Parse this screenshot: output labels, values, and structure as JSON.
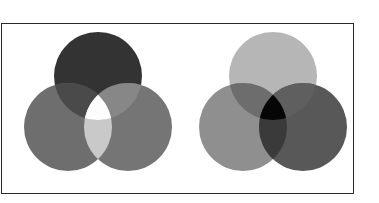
{
  "page": {
    "background_color": "#ffffff",
    "width": 379,
    "height": 203
  },
  "frame": {
    "border_color": "#2a2a2a",
    "border_width": 1,
    "background_color": "#ffffff"
  },
  "figure": {
    "title": "",
    "caption": "",
    "diagram_count": 2
  },
  "chart_data": {
    "type": "diagram",
    "subtype": "venn",
    "title": "",
    "geometry": {
      "circle_radius": 44,
      "viewbox": "0 0 176 169"
    },
    "diagrams": [
      {
        "id": "additive",
        "name": "additive-mixing",
        "label": "",
        "center_result": "white",
        "center_color": "#fdfdfd",
        "circles": [
          {
            "name": "top-circle",
            "position": "top",
            "cx": 88,
            "cy": 52,
            "r": 44,
            "color": "#333333",
            "gray_value": 51
          },
          {
            "name": "left-circle",
            "position": "bottom-left",
            "cx": 58,
            "cy": 103,
            "r": 44,
            "color": "#6e6e6e",
            "gray_value": 110
          },
          {
            "name": "right-circle",
            "position": "bottom-right",
            "cx": 118,
            "cy": 103,
            "r": 44,
            "color": "#757575",
            "gray_value": 117
          }
        ],
        "overlaps": [
          {
            "name": "top-left-overlap",
            "circles": [
              "top-circle",
              "left-circle"
            ],
            "color": "#4a4a4a",
            "gray_value": 74
          },
          {
            "name": "top-right-overlap",
            "circles": [
              "top-circle",
              "right-circle"
            ],
            "color": "#878787",
            "gray_value": 135
          },
          {
            "name": "left-right-overlap",
            "circles": [
              "left-circle",
              "right-circle"
            ],
            "color": "#c9c9c9",
            "gray_value": 201
          },
          {
            "name": "center-overlap",
            "circles": [
              "top-circle",
              "left-circle",
              "right-circle"
            ],
            "color": "#fdfdfd",
            "gray_value": 253
          }
        ]
      },
      {
        "id": "subtractive",
        "name": "subtractive-mixing",
        "label": "",
        "center_result": "black",
        "center_color": "#000000",
        "circles": [
          {
            "name": "top-circle",
            "position": "top",
            "cx": 88,
            "cy": 52,
            "r": 44,
            "color": "#b6b6b6",
            "gray_value": 182
          },
          {
            "name": "left-circle",
            "position": "bottom-left",
            "cx": 58,
            "cy": 103,
            "r": 44,
            "color": "#8f8f8f",
            "gray_value": 143
          },
          {
            "name": "right-circle",
            "position": "bottom-right",
            "cx": 118,
            "cy": 103,
            "r": 44,
            "color": "#585858",
            "gray_value": 88
          }
        ],
        "overlaps": [
          {
            "name": "top-left-overlap",
            "circles": [
              "top-circle",
              "left-circle"
            ],
            "color": "#6d6d6d",
            "gray_value": 109
          },
          {
            "name": "top-right-overlap",
            "circles": [
              "top-circle",
              "right-circle"
            ],
            "color": "#5f5f5f",
            "gray_value": 95
          },
          {
            "name": "left-right-overlap",
            "circles": [
              "left-circle",
              "right-circle"
            ],
            "color": "#3a3a3a",
            "gray_value": 58
          },
          {
            "name": "center-overlap",
            "circles": [
              "top-circle",
              "left-circle",
              "right-circle"
            ],
            "color": "#060606",
            "gray_value": 6
          }
        ]
      }
    ]
  }
}
